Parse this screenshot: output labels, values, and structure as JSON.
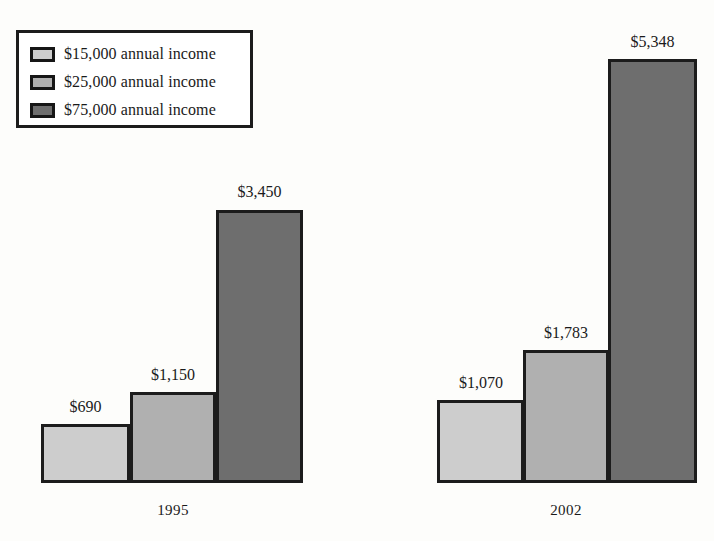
{
  "legend": {
    "items": [
      {
        "label": "$15,000 annual income",
        "color": "#cdcdcd",
        "swatch_name": "legend-swatch-15000"
      },
      {
        "label": "$25,000 annual income",
        "color": "#b0b0b0",
        "swatch_name": "legend-swatch-25000"
      },
      {
        "label": "$75,000 annual income",
        "color": "#6e6e6e",
        "swatch_name": "legend-swatch-75000"
      }
    ]
  },
  "chart_data": {
    "type": "bar",
    "title": "",
    "subtitle": "",
    "xlabel": "",
    "ylabel": "",
    "grid": false,
    "legend_position": "top-left",
    "axis_visible": false,
    "categories": [
      "1995",
      "2002"
    ],
    "ylim": [
      0,
      5348
    ],
    "value_prefix": "$",
    "series": [
      {
        "name": "$15,000 annual income",
        "color": "#cdcdcd",
        "values": [
          690,
          1070
        ],
        "labels": [
          "$690",
          "$1,070"
        ]
      },
      {
        "name": "$25,000 annual income",
        "color": "#b0b0b0",
        "values": [
          1150,
          1783
        ],
        "labels": [
          "$1,150",
          "$1,783"
        ]
      },
      {
        "name": "$75,000 annual income",
        "color": "#6e6e6e",
        "values": [
          3450,
          5348
        ],
        "labels": [
          "$3,450",
          "$5,348"
        ]
      }
    ]
  },
  "bars": [
    {
      "name": "bar-1995-15000",
      "label": "$690",
      "color": "#cdcdcd",
      "left": 41,
      "top": 424,
      "width": 89,
      "height": 59
    },
    {
      "name": "bar-1995-25000",
      "label": "$1,150",
      "color": "#b0b0b0",
      "left": 130,
      "top": 392,
      "width": 86,
      "height": 91
    },
    {
      "name": "bar-1995-75000",
      "label": "$3,450",
      "color": "#6e6e6e",
      "left": 216,
      "top": 210,
      "width": 87,
      "height": 273
    },
    {
      "name": "bar-2002-15000",
      "label": "$1,070",
      "color": "#cdcdcd",
      "left": 437,
      "top": 400,
      "width": 87,
      "height": 83
    },
    {
      "name": "bar-2002-25000",
      "label": "$1,783",
      "color": "#b0b0b0",
      "left": 523,
      "top": 350,
      "width": 86,
      "height": 133
    },
    {
      "name": "bar-2002-75000",
      "label": "$5,348",
      "color": "#6e6e6e",
      "left": 608,
      "top": 59,
      "width": 89,
      "height": 424
    }
  ],
  "value_labels": [
    {
      "name": "value-label-1995-15000",
      "text": "$690",
      "left": 41,
      "top": 399,
      "width": 89
    },
    {
      "name": "value-label-1995-25000",
      "text": "$1,150",
      "left": 128,
      "top": 367,
      "width": 90
    },
    {
      "name": "value-label-1995-75000",
      "text": "$3,450",
      "left": 214,
      "top": 184,
      "width": 91
    },
    {
      "name": "value-label-2002-15000",
      "text": "$1,070",
      "left": 436,
      "top": 375,
      "width": 90
    },
    {
      "name": "value-label-2002-25000",
      "text": "$1,783",
      "left": 521,
      "top": 325,
      "width": 90
    },
    {
      "name": "value-label-2002-75000",
      "text": "$5,348",
      "left": 607,
      "top": 34,
      "width": 91
    }
  ],
  "group_labels": [
    {
      "name": "group-label-1995",
      "text": "1995",
      "left": 130,
      "top": 503,
      "width": 86
    },
    {
      "name": "group-label-2002",
      "text": "2002",
      "left": 523,
      "top": 503,
      "width": 86
    }
  ]
}
